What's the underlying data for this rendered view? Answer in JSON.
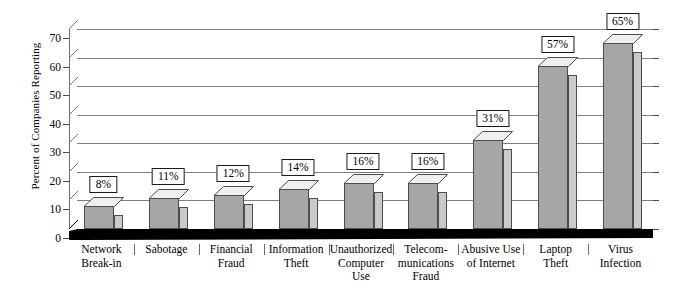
{
  "chart_data": {
    "type": "bar",
    "title": "",
    "xlabel": "",
    "ylabel": "Percent of Companies Reporting",
    "ylim": [
      0,
      70
    ],
    "ytick_step": 10,
    "yticks": [
      "0",
      "10",
      "20",
      "30",
      "40",
      "50",
      "60",
      "70"
    ],
    "grid": true,
    "legend": "none",
    "style": "3d-column",
    "categories": [
      "Network\nBreak-in",
      "Sabotage",
      "Financial\nFraud",
      "Information\nTheft",
      "Unauthorized\nComputer\nUse",
      "Telecom-\nmunications\nFraud",
      "Abusive Use\nof Internet",
      "Laptop\nTheft",
      "Virus\nInfection"
    ],
    "values": [
      8,
      11,
      12,
      14,
      16,
      16,
      31,
      57,
      65
    ],
    "data_labels": [
      "8%",
      "11%",
      "12%",
      "14%",
      "16%",
      "16%",
      "31%",
      "57%",
      "65%"
    ]
  },
  "axis": {
    "y_title": "Percent of Companies Reporting",
    "ticks": [
      {
        "value": 70,
        "label": "70"
      },
      {
        "value": 60,
        "label": "60"
      },
      {
        "value": 50,
        "label": "50"
      },
      {
        "value": 40,
        "label": "40"
      },
      {
        "value": 30,
        "label": "30"
      },
      {
        "value": 20,
        "label": "20"
      },
      {
        "value": 10,
        "label": "10"
      },
      {
        "value": 0,
        "label": "0"
      }
    ]
  },
  "bars": [
    {
      "label_line1": "Network",
      "label_line2": "Break-in",
      "label_line3": "",
      "value": 8,
      "data_label": "8%"
    },
    {
      "label_line1": "Sabotage",
      "label_line2": "",
      "label_line3": "",
      "value": 11,
      "data_label": "11%"
    },
    {
      "label_line1": "Financial",
      "label_line2": "Fraud",
      "label_line3": "",
      "value": 12,
      "data_label": "12%"
    },
    {
      "label_line1": "Information",
      "label_line2": "Theft",
      "label_line3": "",
      "value": 14,
      "data_label": "14%"
    },
    {
      "label_line1": "Unauthorized",
      "label_line2": "Computer",
      "label_line3": "Use",
      "value": 16,
      "data_label": "16%"
    },
    {
      "label_line1": "Telecom-",
      "label_line2": "munications",
      "label_line3": "Fraud",
      "value": 16,
      "data_label": "16%"
    },
    {
      "label_line1": "Abusive Use",
      "label_line2": "of Internet",
      "label_line3": "",
      "value": 31,
      "data_label": "31%"
    },
    {
      "label_line1": "Laptop",
      "label_line2": "Theft",
      "label_line3": "",
      "value": 57,
      "data_label": "57%"
    },
    {
      "label_line1": "Virus",
      "label_line2": "Infection",
      "label_line3": "",
      "value": 65,
      "data_label": "65%"
    }
  ],
  "colors": {
    "bar_front": "#a6a6a6",
    "bar_side": "#cacaca",
    "bar_top": "#efefef",
    "bar_outline": "#4d4d4d",
    "gridline": "#7e7e7e",
    "axis": "#000000",
    "floor": "#000000",
    "background": "#ffffff"
  }
}
